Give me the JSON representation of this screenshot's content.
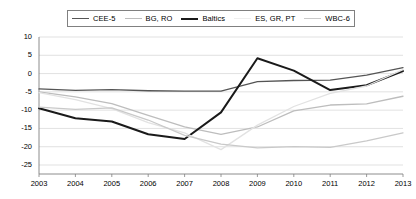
{
  "chart_data": {
    "type": "line",
    "title": "",
    "subtitle": "",
    "xlabel": "",
    "ylabel": "",
    "categories": [
      "2003",
      "2004",
      "2005",
      "2006",
      "2007",
      "2008",
      "2009",
      "2010",
      "2011",
      "2012",
      "2013"
    ],
    "x": [
      2003,
      2004,
      2005,
      2006,
      2007,
      2008,
      2009,
      2010,
      2011,
      2012,
      2013
    ],
    "ylim": [
      -25,
      10
    ],
    "yticks": [
      10,
      5,
      0,
      -5,
      -10,
      -15,
      -20,
      -25
    ],
    "ytick_labels": [
      "10",
      "5",
      "0",
      "-5",
      "-10",
      "-15",
      "-20",
      "-25"
    ],
    "grid": "horizontal",
    "legend_position": "top",
    "series": [
      {
        "name": "CEE-5",
        "color": "#555555",
        "width": 1.3,
        "values": [
          -4.2,
          -4.6,
          -4.4,
          -4.7,
          -4.8,
          -4.8,
          -2.2,
          -1.9,
          -1.8,
          -0.4,
          1.6
        ]
      },
      {
        "name": "BG, RO",
        "color": "#bdbdbd",
        "width": 1.3,
        "values": [
          -5.0,
          -6.4,
          -8.2,
          -11.4,
          -14.6,
          -16.6,
          -14.6,
          -10.2,
          -8.6,
          -8.3,
          -6.2
        ]
      },
      {
        "name": "Baltics",
        "color": "#1a1a1a",
        "width": 2.0,
        "values": [
          -9.5,
          -12.2,
          -13.1,
          -16.6,
          -17.9,
          -10.6,
          4.2,
          0.8,
          -4.5,
          -3.2,
          0.7
        ]
      },
      {
        "name": "ES, GR, PT",
        "color": "#e2e2e2",
        "width": 1.3,
        "values": [
          -5.2,
          -7.1,
          -9.6,
          -13.4,
          -16.2,
          -20.8,
          -14.1,
          -9.0,
          -5.4,
          -3.4,
          1.1
        ]
      },
      {
        "name": "WBC-6",
        "color": "#c9c9c9",
        "width": 1.3,
        "values": [
          -9.2,
          -9.8,
          -9.4,
          -12.7,
          -16.9,
          -19.3,
          -20.3,
          -20.0,
          -20.2,
          -18.4,
          -16.2
        ]
      }
    ]
  },
  "legend": {
    "items": [
      {
        "label": "CEE-5",
        "swatch_color": "#555555",
        "swatch_height": 1.4
      },
      {
        "label": "BG, RO",
        "swatch_color": "#bdbdbd",
        "swatch_height": 1.4
      },
      {
        "label": "Baltics",
        "swatch_color": "#1a1a1a",
        "swatch_height": 2.2
      },
      {
        "label": "ES, GR, PT",
        "swatch_color": "#efefef",
        "swatch_height": 1.4
      },
      {
        "label": "WBC-6",
        "swatch_color": "#c9c9c9",
        "swatch_height": 1.4
      }
    ]
  },
  "axes": {
    "y_tick_labels": [
      "10",
      "5",
      "0",
      "-5",
      "-10",
      "-15",
      "-20",
      "-25"
    ],
    "x_tick_labels": [
      "2003",
      "2004",
      "2005",
      "2006",
      "2007",
      "2008",
      "2009",
      "2010",
      "2011",
      "2012",
      "2013"
    ]
  },
  "colors": {
    "grid": "#d9d9d9",
    "axis": "#808080",
    "background": "#ffffff"
  }
}
